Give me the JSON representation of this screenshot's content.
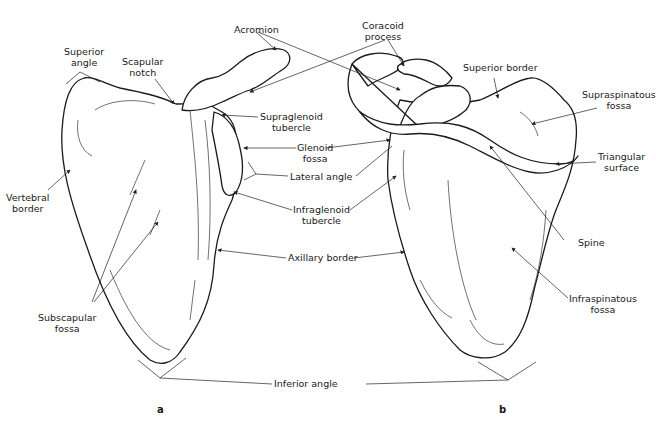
{
  "figure": {
    "subject": "Scapula",
    "panels": [
      {
        "id": "a",
        "caption": "a",
        "view": "anterior (costal) surface"
      },
      {
        "id": "b",
        "caption": "b",
        "view": "posterior (dorsal) surface"
      }
    ],
    "labels": {
      "acromion": "Acromion",
      "coracoid_process": "Coracoid\nprocess",
      "superior_angle": "Superior\nangle",
      "scapular_notch": "Scapular\nnotch",
      "supraglenoid_tubercle": "Supraglenoid\ntubercle",
      "glenoid_fossa": "Glenoid\nfossa",
      "lateral_angle": "Lateral angle",
      "vertebral_border": "Vertebral\nborder",
      "infraglenoid_tubercle": "Infraglenoid\ntubercle",
      "axillary_border": "Axillary border",
      "subscapular_fossa": "Subscapular\nfossa",
      "inferior_angle": "Inferior angle",
      "superior_border": "Superior border",
      "supraspinatous_fossa": "Supraspinatous\nfossa",
      "triangular_surface": "Triangular\nsurface",
      "spine": "Spine",
      "infraspinatous_fossa": "Infraspinatous\nfossa"
    },
    "colors": {
      "ink": "#1a1a1a",
      "background": "#ffffff"
    }
  }
}
